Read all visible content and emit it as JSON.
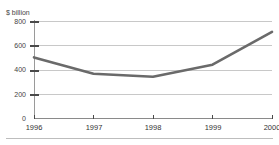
{
  "chart_data": {
    "type": "line",
    "title": "",
    "subtitle": "",
    "xlabel": "",
    "ylabel": "$ billion",
    "categories": [
      "1996",
      "1997",
      "1998",
      "1999",
      "2000"
    ],
    "x": [
      1996,
      1997,
      1998,
      1999,
      2000
    ],
    "values": [
      500,
      365,
      340,
      440,
      710
    ],
    "series": [
      {
        "name": "",
        "values": [
          500,
          365,
          340,
          440,
          710
        ]
      }
    ],
    "ylim": [
      0,
      800
    ],
    "yticks": [
      0,
      200,
      400,
      600,
      800
    ],
    "ytick_labels": [
      "0",
      "200",
      "400",
      "600",
      "800"
    ],
    "xlim": [
      1996,
      2000
    ],
    "xticks": [
      1996,
      1997,
      1998,
      1999,
      2000
    ],
    "xtick_labels": [
      "1996",
      "1997",
      "1998",
      "1999",
      "2000"
    ],
    "grid": true,
    "legend": false,
    "legend_position": "none",
    "line_color": "#6a6a6a",
    "grid_color": "#c8c8c8",
    "axis_color": "#8a8a8a",
    "background_color": "#ffffff"
  },
  "axes": {
    "y_axis_unit_label": "$ billion",
    "y_ticks": [
      {
        "label": "800",
        "value": 800
      },
      {
        "label": "600",
        "value": 600
      },
      {
        "label": "400",
        "value": 400
      },
      {
        "label": "200",
        "value": 200
      },
      {
        "label": "0",
        "value": 0
      }
    ],
    "x_ticks": [
      {
        "label": "1996",
        "value": 1996
      },
      {
        "label": "1997",
        "value": 1997
      },
      {
        "label": "1998",
        "value": 1998
      },
      {
        "label": "1999",
        "value": 1999
      },
      {
        "label": "2000",
        "value": 2000
      }
    ]
  }
}
